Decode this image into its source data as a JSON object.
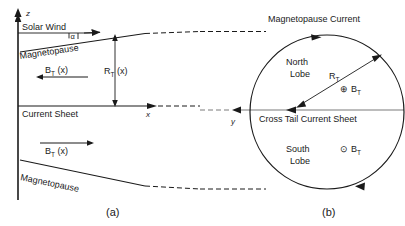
{
  "figure": {
    "title_absent": true,
    "panels": [
      {
        "id": "a",
        "label": "(a)",
        "view": "noon-midnight meridian (x-z) cross-section"
      },
      {
        "id": "b",
        "label": "(b)",
        "view": "tail cross-section (y-z plane)"
      }
    ]
  },
  "panel_a": {
    "axis_z_label": "z",
    "axis_x_label": "x",
    "solar_wind_label": "Solar Wind",
    "magnetopause_top_label": "Magnetopause",
    "magnetopause_bottom_label": "Magnetopause",
    "current_sheet_label": "Current Sheet",
    "flare_angle_label": "α",
    "radius_label_main": "R",
    "radius_label_sub": "T",
    "radius_label_arg": " (x)",
    "field_north_main": "B",
    "field_north_sub": "T",
    "field_north_arg": " (x)",
    "field_north_direction": "left",
    "field_south_main": "B",
    "field_south_sub": "T",
    "field_south_arg": " (x)",
    "field_south_direction": "right",
    "panel_label": "(a)"
  },
  "panel_b": {
    "magnetopause_current_label": "Magnetopause Current",
    "north_lobe_line1": "North",
    "north_lobe_line2": "Lobe",
    "south_lobe_line1": "South",
    "south_lobe_line2": "Lobe",
    "cross_tail_current_sheet_label": "Cross Tail Current Sheet",
    "axis_y_label": "y",
    "radius_label_main": "R",
    "radius_label_sub": "T",
    "field_into_page_symbol": "⊕",
    "field_into_page_main": "B",
    "field_into_page_sub": "T",
    "field_out_of_page_symbol": "⊙",
    "field_out_of_page_main": "B",
    "field_out_of_page_sub": "T",
    "panel_label": "(b)"
  },
  "colors": {
    "ink": "#1a1a1a",
    "grey_rule": "#7a7a7a",
    "background": "#ffffff"
  }
}
